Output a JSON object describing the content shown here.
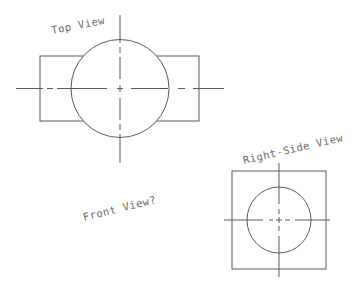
{
  "diagram": {
    "type": "orthographic-projection-drawing",
    "line_color": "#5a5a5a",
    "text_color": "#6a6a6a",
    "background": "#ffffff",
    "views": {
      "top": {
        "label": "Top View",
        "label_pos": {
          "x": 52,
          "y": 34,
          "rotate": -11
        },
        "rect": {
          "x": 40,
          "y": 56,
          "width": 159,
          "height": 65
        },
        "circle": {
          "cx": 120,
          "cy": 88.5,
          "r": 49
        },
        "center_h": {
          "y": 88.5,
          "x1": 16,
          "x2": 224
        },
        "center_v": {
          "x": 120,
          "y1": 15,
          "y2": 163
        }
      },
      "right_side": {
        "label": "Right-Side View",
        "label_pos": {
          "x": 244,
          "y": 164,
          "rotate": -13
        },
        "rect": {
          "x": 232,
          "y": 171,
          "width": 94,
          "height": 98
        },
        "ellipse": {
          "cx": 279,
          "cy": 220,
          "rx": 32,
          "ry": 33
        },
        "center_h": {
          "y": 220,
          "x1": 224,
          "x2": 330
        },
        "center_v": {
          "x": 279,
          "y1": 163,
          "y2": 277
        }
      },
      "front": {
        "label": "Front View?",
        "label_pos": {
          "x": 84,
          "y": 221,
          "rotate": -14
        }
      }
    }
  }
}
